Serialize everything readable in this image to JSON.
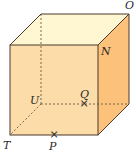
{
  "diagram": {
    "type": "cube",
    "colors": {
      "front": "#FCDCA8",
      "side": "#FCC17A",
      "top": "#FEF7D2",
      "edge": "#4a3a2a",
      "hidden_edge": "#6a5a48"
    },
    "vertices": {
      "T": {
        "label": "T"
      },
      "U": {
        "label": "U"
      },
      "N": {
        "label": "N"
      },
      "O": {
        "label": "O"
      }
    },
    "points": {
      "P": {
        "label": "P"
      },
      "Q": {
        "label": "Q"
      }
    },
    "cross_mark": "×"
  }
}
